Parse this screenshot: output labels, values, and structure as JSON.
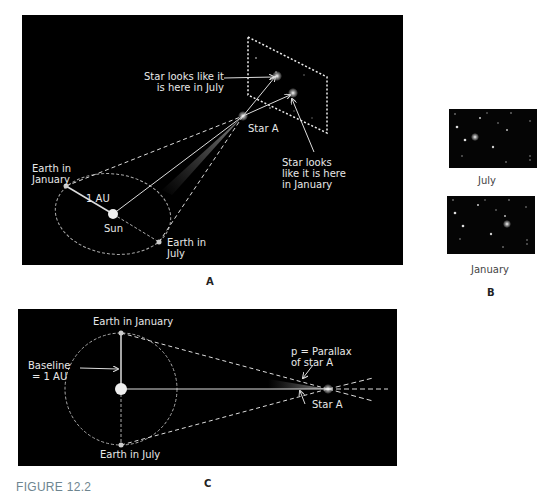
{
  "panel_a": {
    "label": "A",
    "annotations": {
      "july_position": "Star looks like it",
      "july_position_2": "is here in July",
      "star": "Star A",
      "january_position": "Star looks",
      "january_position_2": "like it is here",
      "january_position_3": "in January",
      "earth_january": "Earth in",
      "earth_january_2": "January",
      "distance": "1 AU",
      "sun": "Sun",
      "earth_july": "Earth in",
      "earth_july_2": "July"
    }
  },
  "panel_b": {
    "label": "B",
    "images": [
      {
        "caption": "July"
      },
      {
        "caption": "January"
      }
    ]
  },
  "panel_c": {
    "label": "C",
    "annotations": {
      "earth_january": "Earth in January",
      "baseline": "Baseline",
      "baseline_2": "= 1 AU",
      "parallax": "p = Parallax",
      "parallax_2": "of star A",
      "star": "Star A",
      "earth_july": "Earth in July"
    }
  },
  "figure_caption": "FIGURE 12.2",
  "colors": {
    "background": "#000000",
    "line": "#e0e0e0",
    "caption": "#6e8590"
  }
}
